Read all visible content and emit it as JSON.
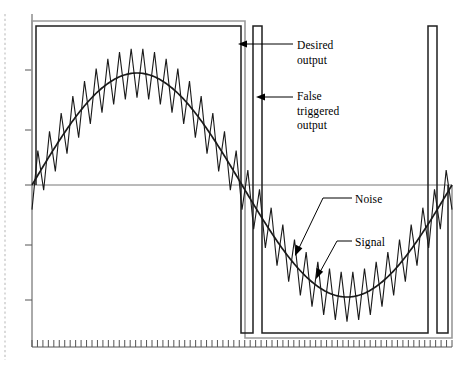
{
  "figure": {
    "kind": "oscilloscope-waveform-diagram",
    "background_color": "#ffffff",
    "trace_color": "#1a1a1a",
    "secondary_trace_color": "#8c8c8c",
    "axis_color": "#444444",
    "dotted_rule_color": "#bdbdbd"
  },
  "annotations": {
    "desired_output": {
      "lines": [
        "Desired",
        "output"
      ],
      "line1": "Desired",
      "line2": "output"
    },
    "false_triggered_output": {
      "lines": [
        "False",
        "triggered",
        "output"
      ],
      "line1": "False",
      "line2": "triggered",
      "line3": "output"
    },
    "noise": {
      "label": "Noise"
    },
    "signal": {
      "label": "Signal"
    }
  },
  "axes": {
    "x_axis": {
      "label": "",
      "y_pixel": 347,
      "x_start": 32,
      "x_end": 452,
      "tick_count": 77,
      "tick_length": 7,
      "show_labels": false
    },
    "y_axis": {
      "label": "",
      "x_pixel": 32,
      "y_top": 14,
      "y_bottom": 347,
      "tick_values": [
        70,
        130,
        185,
        245,
        300
      ],
      "tick_length": 7,
      "show_labels": false
    },
    "zero_line": {
      "y_pixel": 185,
      "x_start": 32,
      "x_end": 452
    },
    "left_dotted_rule": {
      "x_pixel": 5,
      "y_top": 14,
      "y_bottom": 360
    }
  },
  "chart_data": {
    "type": "line",
    "xlabel": "",
    "ylabel": "",
    "xlim": [
      0,
      1
    ],
    "ylim": [
      -1.25,
      1.25
    ],
    "grid": false,
    "legend": "none",
    "series": [
      {
        "name": "Signal",
        "kind": "sine",
        "description": "Clean sinusoidal input signal, one full cycle",
        "amplitude": 1.0,
        "cycles": 1,
        "phase_deg": 0,
        "color": "#1a1a1a"
      },
      {
        "name": "Noise",
        "kind": "noisy-sine",
        "description": "Signal plus high-frequency triangular noise, zigzag overlay",
        "amplitude": 1.0,
        "noise_amplitude": 0.22,
        "noise_periods": 36,
        "color": "#1a1a1a"
      },
      {
        "name": "Desired output",
        "kind": "square",
        "description": "Ideal comparator square wave: high for first half cycle, low for second half",
        "high_level": 1.12,
        "low_level": -1.12,
        "transitions": [
          0.0,
          0.5,
          1.0
        ],
        "color": "#8c8c8c"
      },
      {
        "name": "False triggered output",
        "kind": "square-with-glitch",
        "description": "Comparator output with extra narrow pulses caused by noise at the zero crossings",
        "high_level": 1.12,
        "low_level": -1.12,
        "glitch_pulses": [
          {
            "start": 0.527,
            "end": 0.549
          },
          {
            "start": 0.943,
            "end": 0.965
          }
        ],
        "color": "#1a1a1a"
      }
    ]
  }
}
